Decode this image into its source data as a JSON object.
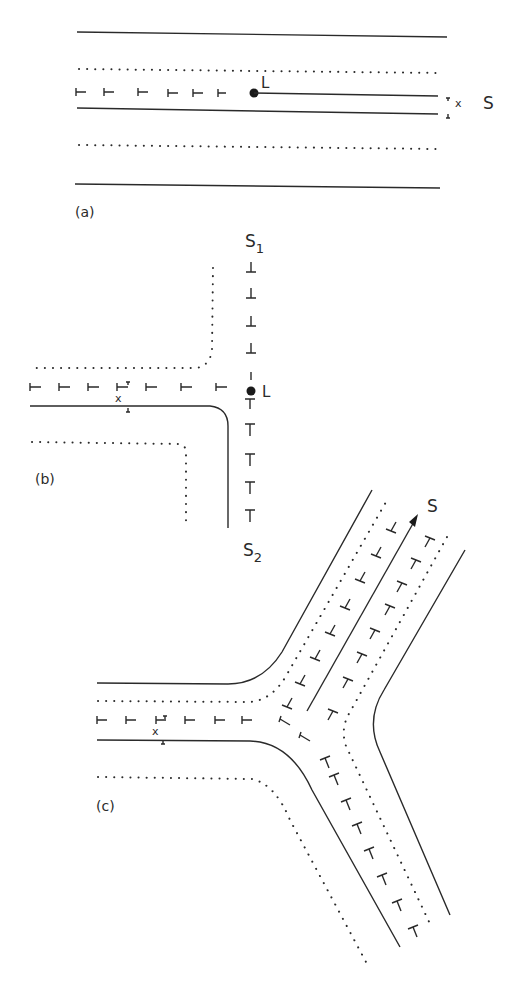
{
  "figure": {
    "panels": [
      {
        "id": "a",
        "label": "(a)",
        "node_label": "L",
        "side_label": "S",
        "marker_label": "x"
      },
      {
        "id": "b",
        "label": "(b)",
        "node_label": "L",
        "top_label": "S",
        "top_label_sub": "1",
        "bottom_label": "S",
        "bottom_label_sub": "2",
        "marker_label": "x"
      },
      {
        "id": "c",
        "label": "(c)",
        "arrow_label": "S",
        "marker_label": "x"
      }
    ]
  }
}
